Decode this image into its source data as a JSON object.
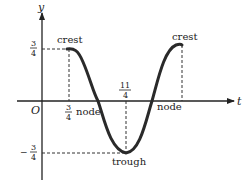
{
  "diagram": {
    "type": "wave",
    "axes": {
      "x_label": "t",
      "y_label": "y",
      "origin_label": "O"
    },
    "amplitude_ticks": {
      "top": {
        "num": "3",
        "den": "4",
        "sign": ""
      },
      "bottom": {
        "num": "3",
        "den": "4",
        "sign": "−"
      }
    },
    "t_ticks": [
      {
        "num": "3",
        "den": "4"
      },
      {
        "num": "11",
        "den": "4"
      }
    ],
    "labels": {
      "crest_left": "crest",
      "crest_right": "crest",
      "node_left": "node",
      "node_right": "node",
      "trough": "trough"
    },
    "colors": {
      "curve": "#2a2a2a",
      "axes": "#222222",
      "dash": "#333333",
      "text": "#222222"
    }
  }
}
